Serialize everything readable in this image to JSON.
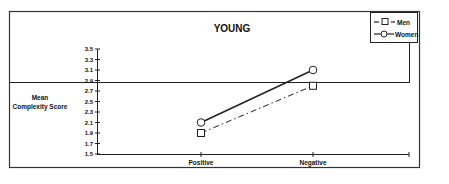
{
  "chart_data": {
    "type": "line",
    "title": "YOUNG",
    "xlabel": "",
    "ylabel": "Mean Complexity Score",
    "ylabel_lines": [
      "Mean",
      "Complexity Score"
    ],
    "categories": [
      "Positive",
      "Negative"
    ],
    "yticks": [
      "3.5",
      "3.3",
      "3.1",
      "2.9",
      "2.7",
      "2.5",
      "2.3",
      "2.1",
      "1.9",
      "1.7",
      "1.5"
    ],
    "ylim": [
      1.5,
      3.5
    ],
    "grid": false,
    "legend_position": "top-right",
    "series": [
      {
        "name": "Men",
        "marker": "square",
        "line": "dash-dot",
        "values": [
          1.9,
          2.8
        ]
      },
      {
        "name": "Women",
        "marker": "circle",
        "line": "solid",
        "values": [
          2.1,
          3.1
        ]
      }
    ]
  },
  "legend": {
    "men": "Men",
    "women": "Women"
  }
}
